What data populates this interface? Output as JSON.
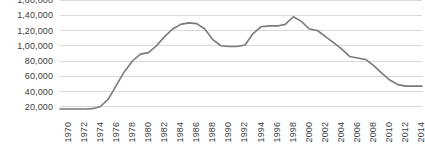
{
  "chart_data": {
    "type": "line",
    "title": "",
    "subtitle": "",
    "xlabel": "",
    "ylabel": "",
    "grid": true,
    "legend": false,
    "legend_position": "none",
    "line_color": "#7a7a7a",
    "grid_color": "#d9d9d9",
    "label_color": "#3c3c3c",
    "background": "#ffffff",
    "ylim": [
      0,
      160000
    ],
    "y_ticks": [
      20000,
      40000,
      60000,
      80000,
      100000,
      120000,
      140000,
      160000
    ],
    "y_tick_labels": [
      "20,000",
      "40,000",
      "60,000",
      "80,000",
      "1,00,000",
      "1,20,000",
      "1,40,000",
      "1,60,000"
    ],
    "x_tick_labels": [
      "1970",
      "1972",
      "1974",
      "1976",
      "1978",
      "1980",
      "1982",
      "1984",
      "1986",
      "1988",
      "1990",
      "1992",
      "1994",
      "1996",
      "1998",
      "2000",
      "2002",
      "2004",
      "2006",
      "2008",
      "2010",
      "2012",
      "2014"
    ],
    "xlim": [
      1970,
      2015
    ],
    "x": [
      1970,
      1971,
      1972,
      1973,
      1974,
      1975,
      1976,
      1977,
      1978,
      1979,
      1980,
      1981,
      1982,
      1983,
      1984,
      1985,
      1986,
      1987,
      1988,
      1989,
      1990,
      1991,
      1992,
      1993,
      1994,
      1995,
      1996,
      1997,
      1998,
      1999,
      2000,
      2001,
      2002,
      2003,
      2004,
      2005,
      2006,
      2007,
      2008,
      2009,
      2010,
      2011,
      2012,
      2013,
      2014,
      2015
    ],
    "values": [
      17000,
      17000,
      17000,
      17000,
      17500,
      20000,
      30000,
      48000,
      66000,
      80000,
      89000,
      91000,
      100000,
      112000,
      122000,
      128000,
      130000,
      129000,
      122000,
      108000,
      100000,
      99000,
      99000,
      101000,
      116000,
      125000,
      126000,
      126000,
      128000,
      138000,
      132000,
      122000,
      120000,
      112000,
      104000,
      96000,
      86000,
      84000,
      82000,
      74000,
      64000,
      55000,
      49000,
      47000,
      47000,
      47000
    ]
  }
}
